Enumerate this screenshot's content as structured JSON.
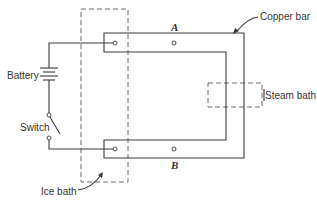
{
  "diagram": {
    "type": "thermoelectric circuit schematic",
    "labels": {
      "battery": "Battery",
      "switch": "Switch",
      "ice_bath": "Ice bath",
      "steam_bath": "Steam bath",
      "copper_bar": "Copper bar",
      "point_a": "A",
      "point_b": "B"
    },
    "colors": {
      "line": "#3a3a3a",
      "dashed_box": "#6a6a6a",
      "background": "#ffffff"
    }
  }
}
